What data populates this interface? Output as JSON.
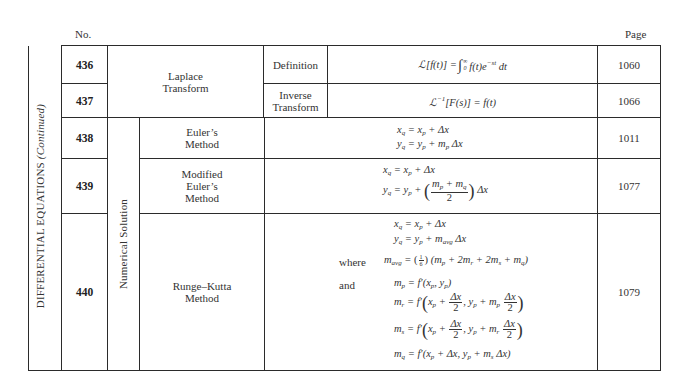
{
  "headers": {
    "no": "No.",
    "page": "Page"
  },
  "section_label": {
    "main": "DIFFERENTIAL EQUATIONS",
    "suffix": "(Continued)"
  },
  "group_label": "Numerical Solution",
  "rows": [
    {
      "no": "436",
      "topic": "Laplace Transform",
      "sub": "Definition",
      "formula": "ℒ[f(t)] = ∫_0^∞ f(t)e^(−st) dt",
      "page": "1060"
    },
    {
      "no": "437",
      "topic": "Laplace Transform",
      "sub": "Inverse Transform",
      "formula": "ℒ^(−1)[F(s)] = f(t)",
      "page": "1066"
    },
    {
      "no": "438",
      "topic": "Euler's Method",
      "formula": [
        "x_q = x_p + Δx",
        "y_q = y_p + m_p Δx"
      ],
      "page": "1011"
    },
    {
      "no": "439",
      "topic": "Modified Euler's Method",
      "formula": [
        "x_q = x_p + Δx",
        "y_q = y_p + ((m_p + m_q)/2) Δx"
      ],
      "page": "1077"
    },
    {
      "no": "440",
      "topic": "Runge–Kutta Method",
      "formula": [
        "x_q = x_p + Δx",
        "y_q = y_p + m_avg Δx",
        "m_avg = (1/6)(m_p + 2m_r + 2m_s + m_q)",
        "m_p = f'(x_p, y_p)",
        "m_r = f'(x_p + Δx/2, y_p + m_p Δx/2)",
        "m_s = f'(x_p + Δx/2, y_p + m_r Δx/2)",
        "m_q = f'(x_p + Δx, y_p + m_s Δx)"
      ],
      "labels": {
        "where": "where",
        "and": "and"
      },
      "page": "1079"
    }
  ],
  "text": {
    "laplace_1": "Laplace",
    "laplace_2": "Transform",
    "definition": "Definition",
    "inverse_1": "Inverse",
    "inverse_2": "Transform",
    "euler_1": "Euler’s",
    "euler_2": "Method",
    "mod_1": "Modified",
    "mod_2": "Euler’s",
    "mod_3": "Method",
    "rk_1": "Runge–Kutta",
    "rk_2": "Method"
  }
}
